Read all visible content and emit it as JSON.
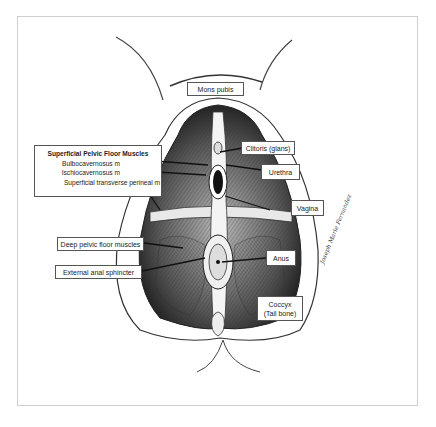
{
  "figure": {
    "labels": {
      "mons_pubis": "Mons pubis",
      "clitoris": "Clitoris (glans)",
      "urethra": "Urethra",
      "vagina": "Vagina",
      "deep_pelvic": "Deep pelvic floor muscles",
      "external_anal_sphincter": "External anal sphincter",
      "anus": "Anus",
      "coccyx_line1": "Coccyx",
      "coccyx_line2": "(Tail bone)"
    },
    "superficial_group": {
      "title": "Superficial Pelvic Floor Muscles",
      "items": [
        "Bulbocavernosus m",
        "Ischiocavernosus m",
        "Superficial transverse perineal m"
      ]
    },
    "signature": "Joseph Marie Fernandez",
    "colors": {
      "ink": "#222222",
      "frame": "#cfcfcf",
      "background": "#ffffff"
    }
  }
}
